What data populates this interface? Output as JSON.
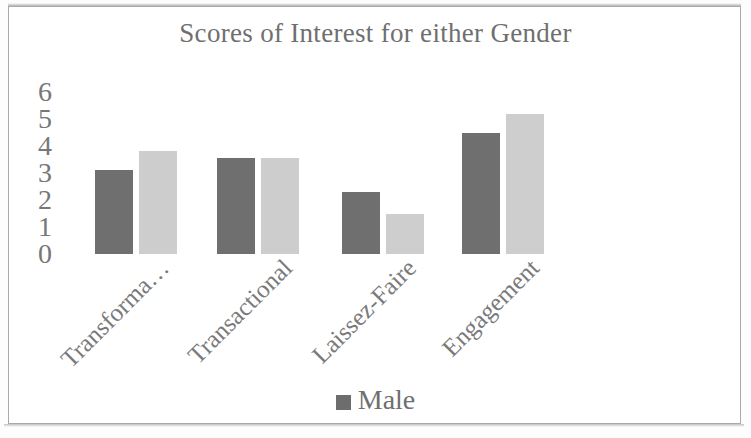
{
  "chart_data": {
    "type": "bar",
    "title": "Scores of Interest for either Gender",
    "xlabel": "",
    "ylabel": "",
    "categories": [
      "Transforma…",
      "Transactional",
      "Laissez-Faire",
      "Engagement"
    ],
    "series": [
      {
        "name": "Male",
        "color": "#6d6d6d",
        "values": [
          3.1,
          3.55,
          2.3,
          4.5
        ]
      },
      {
        "name": "Female",
        "color": "#d2d2d2",
        "values": [
          3.8,
          3.55,
          1.5,
          5.2
        ]
      }
    ],
    "ylim": [
      0,
      6
    ],
    "yticks": [
      "6",
      "5",
      "4",
      "3",
      "2",
      "1",
      "0"
    ],
    "grid": false,
    "legend_position": "bottom",
    "legend_visible_entries": [
      "Male"
    ]
  },
  "legend": {
    "entries": [
      {
        "label": "Male",
        "color": "#6d6d6d"
      }
    ]
  },
  "colors": {
    "male_bar": "#6d6d6d",
    "female_bar": "#d2d2d2",
    "frame": "#a9a9a9",
    "text": "#6f6f6f",
    "background": "#ffffff"
  }
}
